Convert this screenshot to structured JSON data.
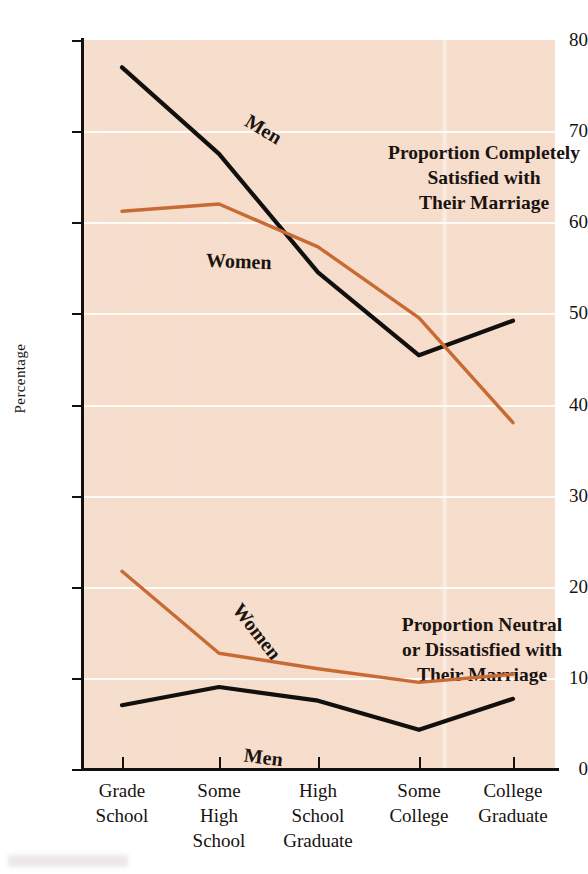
{
  "chart_data": {
    "type": "line",
    "title": "",
    "xlabel": "",
    "ylabel": "Percentage",
    "ylim": [
      0,
      80
    ],
    "yticks": [
      0,
      10,
      20,
      30,
      40,
      50,
      60,
      70,
      80
    ],
    "grid": "horizontal",
    "legend": "inline-labels",
    "categories": [
      "Grade School",
      "Some High School",
      "High School Graduate",
      "Some College",
      "College Graduate"
    ],
    "category_lines": [
      [
        "Grade",
        "School"
      ],
      [
        "Some",
        "High",
        "School"
      ],
      [
        "High",
        "School",
        "Graduate"
      ],
      [
        "Some",
        "College"
      ],
      [
        "College",
        "Graduate"
      ]
    ],
    "series": [
      {
        "name": "Men",
        "group": "Proportion Completely Satisfied with Their Marriage",
        "color": "#12100e",
        "values": [
          77.0,
          67.5,
          54.5,
          45.4,
          49.2
        ]
      },
      {
        "name": "Women",
        "group": "Proportion Completely Satisfied with Their Marriage",
        "color": "#c86a34",
        "values": [
          61.2,
          62.0,
          57.3,
          49.5,
          38.0
        ]
      },
      {
        "name": "Women",
        "group": "Proportion Neutral or Dissatisfied with Their Marriage",
        "color": "#c86a34",
        "values": [
          21.7,
          12.7,
          11.0,
          9.5,
          10.4
        ]
      },
      {
        "name": "Men",
        "group": "Proportion Neutral or Dissatisfied with Their Marriage",
        "color": "#12100e",
        "values": [
          7.0,
          9.0,
          7.5,
          4.3,
          7.7
        ]
      }
    ],
    "annotations": [
      {
        "id": "satisfied",
        "lines": [
          "Proportion Completely",
          "Satisfied with",
          "Their Marriage"
        ]
      },
      {
        "id": "neutral",
        "lines": [
          "Proportion Neutral",
          "or Dissatisfied with",
          "Their Marriage"
        ]
      }
    ],
    "series_labels": [
      {
        "id": "men-top",
        "text": "Men"
      },
      {
        "id": "women-top",
        "text": "Women"
      },
      {
        "id": "women-bot",
        "text": "Women"
      },
      {
        "id": "men-bot",
        "text": "Men"
      }
    ],
    "colors": {
      "plot_background": "#f6ddcb",
      "gridline": "#fffdfa",
      "axis": "#15100d",
      "men_line": "#12100e",
      "women_line": "#c86a34"
    }
  },
  "axis": {
    "y_title": "Percentage",
    "y_tick_labels": [
      "80",
      "70",
      "60",
      "50",
      "40",
      "30",
      "20",
      "10",
      "0"
    ]
  },
  "notes": {
    "satisfied_l1": "Proportion Completely",
    "satisfied_l2": "Satisfied with",
    "satisfied_l3": "Their Marriage",
    "neutral_l1": "Proportion Neutral",
    "neutral_l2": "or Dissatisfied with",
    "neutral_l3": "Their Marriage"
  },
  "series_labels": {
    "men_top": "Men",
    "women_top": "Women",
    "women_bottom": "Women",
    "men_bottom": "Men"
  },
  "x_labels": {
    "c0_l1": "Grade",
    "c0_l2": "School",
    "c0_l3": "",
    "c1_l1": "Some",
    "c1_l2": "High",
    "c1_l3": "School",
    "c2_l1": "High",
    "c2_l2": "School",
    "c2_l3": "Graduate",
    "c3_l1": "Some",
    "c3_l2": "College",
    "c3_l3": "",
    "c4_l1": "College",
    "c4_l2": "Graduate",
    "c4_l3": ""
  }
}
